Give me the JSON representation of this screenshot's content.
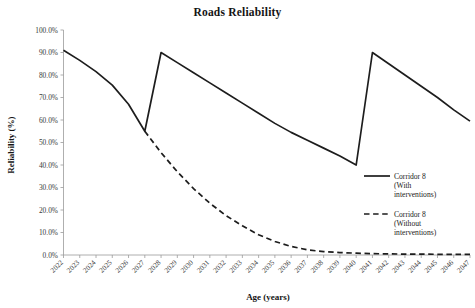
{
  "chart_data": {
    "type": "line",
    "title": "Roads Reliability",
    "xlabel": "Age (years)",
    "ylabel": "Reliability (%)",
    "ylim": [
      0,
      100
    ],
    "ytick_labels": [
      "0.0%",
      "10.0%",
      "20.0%",
      "30.0%",
      "40.0%",
      "50.0%",
      "60.0%",
      "70.0%",
      "80.0%",
      "90.0%",
      "100.0%"
    ],
    "ytick_values": [
      0,
      10,
      20,
      30,
      40,
      50,
      60,
      70,
      80,
      90,
      100
    ],
    "grid": false,
    "legend_position": "right",
    "categories": [
      "2022",
      "2023",
      "2024",
      "2025",
      "2026",
      "2027",
      "2028",
      "2029",
      "2030",
      "2031",
      "2032",
      "2033",
      "2034",
      "2035",
      "2036",
      "2037",
      "2038",
      "2039",
      "2040",
      "2041",
      "2042",
      "2043",
      "2044",
      "2045",
      "2046",
      "2047"
    ],
    "series": [
      {
        "name": "Corridor 8 (With interventions)",
        "style": "solid",
        "color": "#1d1d1d",
        "values": [
          91.0,
          86.5,
          81.5,
          75.5,
          67.0,
          55.0,
          90.0,
          85.5,
          81.0,
          76.5,
          72.0,
          67.5,
          63.0,
          58.5,
          54.5,
          51.0,
          47.5,
          44.0,
          40.0,
          90.0,
          85.0,
          80.0,
          75.0,
          70.0,
          64.5,
          59.5
        ]
      },
      {
        "name": "Corridor 8 (Without interventions)",
        "style": "dashed",
        "color": "#1d1d1d",
        "values": [
          null,
          null,
          null,
          null,
          null,
          55.0,
          45.5,
          37.0,
          29.5,
          23.0,
          17.5,
          13.0,
          9.0,
          6.0,
          3.8,
          2.3,
          1.5,
          1.1,
          0.8,
          0.6,
          0.5,
          0.4,
          0.4,
          0.3,
          0.3,
          0.3
        ]
      }
    ]
  },
  "legend": {
    "entries": [
      {
        "label_lines": [
          "Corridor 8",
          "(With",
          "interventions)"
        ],
        "style": "solid"
      },
      {
        "label_lines": [
          "Corridor 8",
          "(Without",
          "interventions)"
        ],
        "style": "dashed"
      }
    ],
    "entry_0_line_0": "Corridor 8",
    "entry_0_line_1": "(With",
    "entry_0_line_2": "interventions)",
    "entry_1_line_0": "Corridor 8",
    "entry_1_line_1": "(Without",
    "entry_1_line_2": "interventions)"
  }
}
